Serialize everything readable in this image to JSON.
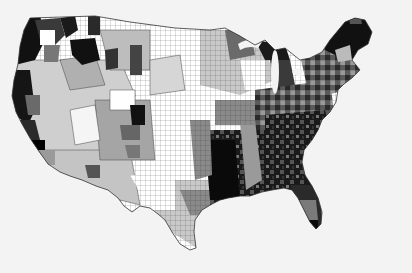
{
  "map": {
    "subject": "Contiguous United States county-level choropleth",
    "style": "grayscale",
    "background_color": "#f3f3f3",
    "border_color": "#444444",
    "shades": [
      "#ffffff",
      "#d4d4d4",
      "#a8a8a8",
      "#6e6e6e",
      "#3a3a3a",
      "#0e0e0e"
    ],
    "regions": [
      {
        "name": "pacific-northwest",
        "shade": 4
      },
      {
        "name": "northern-idaho-montana",
        "shade": 4
      },
      {
        "name": "california-coast",
        "shade": 4
      },
      {
        "name": "great-basin",
        "shade": 1
      },
      {
        "name": "southwest",
        "shade": 1
      },
      {
        "name": "colorado-plateau",
        "shade": 2
      },
      {
        "name": "great-plains",
        "shade": 0
      },
      {
        "name": "texas",
        "shade": 1
      },
      {
        "name": "upper-midwest",
        "shade": 1
      },
      {
        "name": "upper-michigan-wisconsin-north",
        "shade": 4
      },
      {
        "name": "ohio-valley",
        "shade": 3
      },
      {
        "name": "appalachia",
        "shade": 4
      },
      {
        "name": "deep-south",
        "shade": 5
      },
      {
        "name": "mississippi-delta",
        "shade": 5
      },
      {
        "name": "florida",
        "shade": 4
      },
      {
        "name": "northeast",
        "shade": 3
      },
      {
        "name": "maine-new-england-north",
        "shade": 5
      }
    ]
  }
}
